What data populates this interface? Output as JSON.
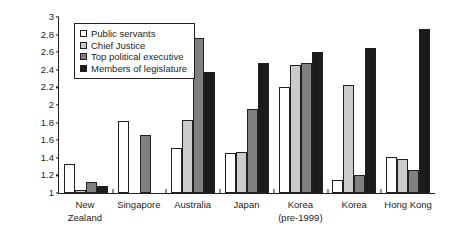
{
  "chart_data": {
    "type": "bar",
    "title": "",
    "xlabel": "",
    "ylabel": "Total pay divided by base pay",
    "ylim": [
      1,
      3
    ],
    "ytick_step": 0.2,
    "yticks": [
      "3",
      "2.8",
      "2.6",
      "2.4",
      "2.2",
      "2",
      "1.8",
      "1.6",
      "1.4",
      "1.2",
      "1"
    ],
    "grid": false,
    "legend_position": "top-left",
    "categories": [
      {
        "label": "New Zealand",
        "sublabel": ""
      },
      {
        "label": "Singapore",
        "sublabel": ""
      },
      {
        "label": "Australia",
        "sublabel": ""
      },
      {
        "label": "Japan",
        "sublabel": ""
      },
      {
        "label": "Korea",
        "sublabel": "(pre-1999)"
      },
      {
        "label": "Korea",
        "sublabel": ""
      },
      {
        "label": "Hong Kong",
        "sublabel": ""
      }
    ],
    "series": [
      {
        "name": "Public servants",
        "color": "#ffffff",
        "values": [
          1.33,
          1.82,
          1.51,
          1.45,
          2.21,
          1.15,
          1.41
        ]
      },
      {
        "name": "Chief Justice",
        "color": "#cbcbcb",
        "values": [
          1.03,
          null,
          1.83,
          1.47,
          2.46,
          2.23,
          1.39
        ]
      },
      {
        "name": "Top political executive",
        "color": "#808080",
        "values": [
          1.13,
          1.66,
          2.76,
          1.96,
          2.48,
          1.21,
          1.26
        ]
      },
      {
        "name": "Members of legislature",
        "color": "#1b1b1b",
        "values": [
          1.08,
          null,
          2.37,
          2.48,
          2.6,
          2.65,
          2.86
        ]
      }
    ]
  }
}
